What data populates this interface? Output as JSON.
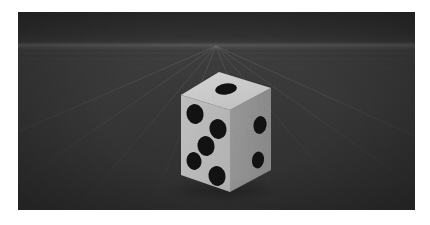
{
  "scene": {
    "title": "3D Dice Render",
    "background_color": "#ffffff",
    "viewport": {
      "x": 18,
      "y": 12,
      "width": 397,
      "height": 198
    },
    "environment": {
      "sky_color": "#2c2c2c",
      "ground_color_near": "#2c2c2c",
      "ground_color_far": "#3b3b3b",
      "horizon_y": 34,
      "horizon_glow_color": "#686868",
      "grid_line_color": "#7d7d7d",
      "grid_visible": true,
      "vanishing_point_x": 198,
      "vanishing_point_y": 34
    }
  },
  "object": {
    "name": "dice",
    "type": "cube",
    "material_color": "#b9b9b9",
    "pip_color": "#111111",
    "shadow_color": "#232323",
    "faces": [
      {
        "name": "top-face",
        "value": 1,
        "fill": "#c9c9c9",
        "polygon": "201,60 253,76 212,98 163,83",
        "pips": [
          {
            "cx": 208,
            "cy": 77,
            "rx": 11,
            "ry": 5.5,
            "rot": -8
          }
        ]
      },
      {
        "name": "front-face",
        "value": 5,
        "fill": "#b7b7b7",
        "polygon": "163,83 212,98 212,180 163,163",
        "pips": [
          {
            "cx": 177,
            "cy": 102,
            "rx": 8.5,
            "ry": 10,
            "rot": -12
          },
          {
            "cx": 200,
            "cy": 117,
            "rx": 8.5,
            "ry": 10,
            "rot": -12
          },
          {
            "cx": 188,
            "cy": 134,
            "rx": 8.5,
            "ry": 10,
            "rot": -12
          },
          {
            "cx": 176,
            "cy": 149,
            "rx": 7.5,
            "ry": 9,
            "rot": -12
          },
          {
            "cx": 199,
            "cy": 164,
            "rx": 8.5,
            "ry": 10,
            "rot": -12
          }
        ]
      },
      {
        "name": "right-face",
        "value": 3,
        "fill": "#8c8c8c",
        "polygon": "212,98 253,76 253,158 212,180",
        "pips": [
          {
            "cx": 242,
            "cy": 113,
            "rx": 6.5,
            "ry": 9,
            "rot": 10
          },
          {
            "cx": 240,
            "cy": 148,
            "rx": 6,
            "ry": 8.5,
            "rot": 10
          }
        ]
      }
    ],
    "edges": {
      "top_left": "163,83 201,60",
      "top_right": "201,60 253,76",
      "vertical_front": "212,98 212,180",
      "vertical_left": "163,83 163,163",
      "vertical_right": "253,76 253,158"
    }
  },
  "labels": {
    "viewport_name": "3d-viewport",
    "object_name": "dice-cube",
    "ground_name": "ground-plane",
    "sky_name": "sky-backdrop"
  }
}
